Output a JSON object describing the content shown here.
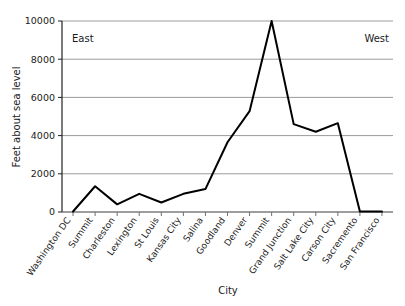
{
  "chart_data": {
    "type": "line",
    "title": "",
    "subtitle": "",
    "xlabel": "City",
    "ylabel": "Feet about sea level",
    "ylim": [
      0,
      10000
    ],
    "yticks": [
      0,
      2000,
      4000,
      6000,
      8000,
      10000
    ],
    "ytick_labels": [
      "0",
      "2000",
      "4000",
      "6000",
      "8000",
      "10000"
    ],
    "grid": true,
    "grid_axis": "y",
    "legend": false,
    "legend_position": "none",
    "line_color": "#000000",
    "grid_color": "#9a9a9a",
    "axis_color": "#222222",
    "background_color": "#ffffff",
    "categories": [
      "Washington DC",
      "Summit",
      "Charleston",
      "Lexington",
      "St Louis",
      "Kansas City",
      "Salina",
      "Goodland",
      "Denver",
      "Summit",
      "Grand Junction",
      "Salt Lake City",
      "Carson City",
      "Sacremento",
      "San Francisco"
    ],
    "values": [
      25,
      1350,
      400,
      950,
      500,
      950,
      1200,
      3650,
      5280,
      10000,
      4600,
      4200,
      4650,
      30,
      20
    ],
    "annotations": [
      {
        "text": "East",
        "x_category": "Washington DC",
        "value": 8900,
        "align": "left"
      },
      {
        "text": "West",
        "x_category": "San Francisco",
        "value": 8900,
        "align": "right"
      }
    ]
  },
  "figure": {
    "width": 405,
    "height": 306
  }
}
